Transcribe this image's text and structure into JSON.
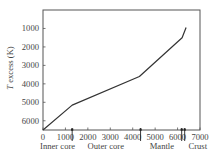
{
  "chart_data": {
    "type": "line",
    "title": "",
    "xlabel": "",
    "ylabel": "T excess (K)",
    "ylabel_italic_part": "T",
    "ylabel_rest": " excess (K)",
    "xlim": [
      0,
      7000
    ],
    "ylim": [
      6500,
      0
    ],
    "y_inverted": true,
    "grid": false,
    "legend": null,
    "x_ticks": [
      0,
      1000,
      2000,
      3000,
      4000,
      5000,
      6000,
      7000
    ],
    "x_tick_labels": [
      "0",
      "1000",
      "2000",
      "3000",
      "4000",
      "5000",
      "6000",
      "7000"
    ],
    "y_ticks": [
      1000,
      2000,
      3000,
      4000,
      5000,
      6000
    ],
    "y_tick_labels": [
      "1000",
      "2000",
      "3000",
      "4000",
      "5000",
      "6000"
    ],
    "series": [
      {
        "name": "T excess",
        "x": [
          0,
          1300,
          4300,
          6200,
          6380
        ],
        "y": [
          6500,
          5150,
          3600,
          1500,
          950
        ],
        "color": "#333333"
      }
    ],
    "boundaries": [
      {
        "x": 1300,
        "style": "single"
      },
      {
        "x": 4350,
        "style": "single"
      },
      {
        "x": 6250,
        "style": "double"
      }
    ],
    "region_labels": [
      {
        "text": "Inner core",
        "x_center": 650
      },
      {
        "text": "Outer core",
        "x_center": 2800
      },
      {
        "text": "Mantle",
        "x_center": 5300
      },
      {
        "text": "Crust",
        "x_center": 6900
      }
    ]
  }
}
